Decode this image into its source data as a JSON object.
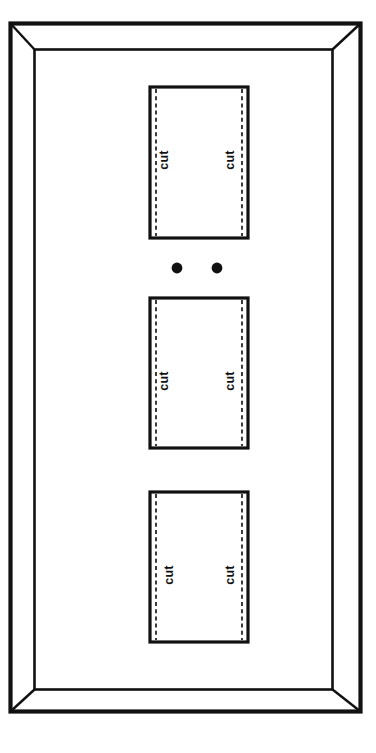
{
  "diagram": {
    "background_color": "#ffffff",
    "line_color": "#111111",
    "frame": {
      "name": "beveled-plate-frame",
      "outer": {
        "x": 10,
        "y": 23,
        "width": 351,
        "height": 689
      },
      "inner": {
        "x": 34,
        "y": 49,
        "width": 299,
        "height": 641
      },
      "miter_corners": [
        "top-left",
        "top-right",
        "bottom-left",
        "bottom-right"
      ]
    },
    "cut_rectangles": [
      {
        "id": "cut-rect-top",
        "x": 150,
        "y": 87,
        "width": 98,
        "height": 151,
        "dash_inset": 6,
        "labels": [
          {
            "text": "cut",
            "side": "left",
            "x": 168,
            "y": 160,
            "rotation": -90
          },
          {
            "text": "cut",
            "side": "right",
            "x": 234,
            "y": 160,
            "rotation": -90
          }
        ]
      },
      {
        "id": "cut-rect-middle",
        "x": 150,
        "y": 298,
        "width": 98,
        "height": 150,
        "dash_inset": 6,
        "labels": [
          {
            "text": "cut",
            "side": "left",
            "x": 168,
            "y": 381,
            "rotation": -90
          },
          {
            "text": "cut",
            "side": "right",
            "x": 234,
            "y": 381,
            "rotation": -90
          }
        ]
      },
      {
        "id": "cut-rect-bottom",
        "x": 150,
        "y": 492,
        "width": 98,
        "height": 150,
        "dash_inset": 6,
        "labels": [
          {
            "text": "cut",
            "side": "left",
            "x": 173,
            "y": 575,
            "rotation": -90
          },
          {
            "text": "cut",
            "side": "right",
            "x": 234,
            "y": 575,
            "rotation": -90
          }
        ]
      }
    ],
    "screw_holes": [
      {
        "id": "screw-hole-left",
        "cx": 177,
        "cy": 268,
        "r": 5.4
      },
      {
        "id": "screw-hole-right",
        "cx": 217,
        "cy": 268,
        "r": 5.4
      }
    ],
    "labels": {
      "cut_text": "cut"
    }
  }
}
